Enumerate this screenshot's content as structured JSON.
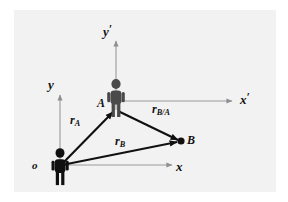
{
  "figure": {
    "background_color": "#f2f2f2",
    "page_color": "#ffffff",
    "width": 288,
    "height": 202
  },
  "labels": {
    "y_prime": "y",
    "y_prime_mark": "′",
    "x_prime": "x",
    "x_prime_mark": "′",
    "y": "y",
    "x": "x",
    "origin": "o",
    "point_a": "A",
    "point_b": "B"
  },
  "vectors": [
    {
      "id": "r_A",
      "base": "r",
      "sub": "A",
      "from": "o",
      "to": "A",
      "color": "#101010"
    },
    {
      "id": "r_B",
      "base": "r",
      "sub": "B",
      "from": "o",
      "to": "B",
      "color": "#101010"
    },
    {
      "id": "r_B/A",
      "base": "r",
      "sub": "B/A",
      "from": "A",
      "to": "B",
      "color": "#101010"
    }
  ],
  "axes": [
    {
      "id": "y-axis",
      "label": "y",
      "origin": "o",
      "direction": "up",
      "color": "#9a9a9a"
    },
    {
      "id": "x-axis",
      "label": "x",
      "origin": "o",
      "direction": "right",
      "color": "#9a9a9a"
    },
    {
      "id": "y-prime-axis",
      "label": "y′",
      "origin": "A",
      "direction": "up",
      "color": "#9a9a9a"
    },
    {
      "id": "x-prime-axis",
      "label": "x′",
      "origin": "A",
      "direction": "right",
      "color": "#9a9a9a"
    }
  ],
  "figures": [
    {
      "id": "observer-o",
      "at": "o",
      "color": "#101010",
      "icon": "person-icon"
    },
    {
      "id": "observer-a",
      "at": "A",
      "color": "#4a4a4a",
      "icon": "person-icon"
    }
  ],
  "points": [
    {
      "id": "point-b",
      "label": "B",
      "color": "#101010",
      "shape": "filled-dot"
    }
  ],
  "colors": {
    "vector": "#101010",
    "axis": "#9a9a9a",
    "figure_origin": "#101010",
    "figure_a": "#4a4a4a",
    "label": "#111111"
  }
}
